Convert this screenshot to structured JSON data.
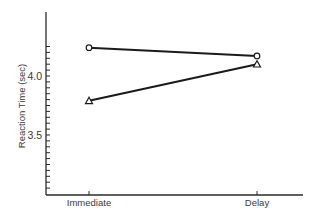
{
  "chart_data": {
    "type": "line",
    "title": "",
    "xlabel": "",
    "ylabel": "Reaction Time (sec)",
    "categories": [
      "Immediate",
      "Delay"
    ],
    "series": [
      {
        "name": "circle",
        "marker": "circle",
        "values": [
          4.24,
          4.17
        ]
      },
      {
        "name": "triangle",
        "marker": "triangle",
        "values": [
          3.79,
          4.1
        ]
      }
    ],
    "ylim": [
      3.0,
      4.3
    ],
    "yticks_labeled": [
      {
        "value": 4.0,
        "label": "4.0"
      },
      {
        "value": 3.5,
        "label": "3.5"
      }
    ],
    "ytick_step": 0.05,
    "grid": false,
    "legend": "none"
  },
  "colors": {
    "axis": "#2a2a2a",
    "line": "#1a1a1a",
    "text": "#3a3a3a",
    "background": "#ffffff"
  }
}
